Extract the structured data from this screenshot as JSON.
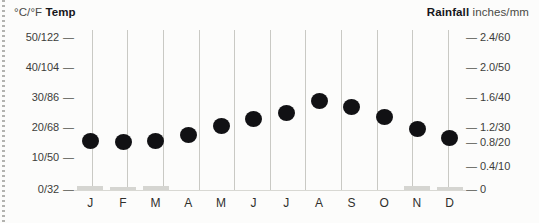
{
  "header": {
    "left_units": "°C/°F",
    "left_title": "Temp",
    "right_title": "Rainfall",
    "right_units": "inches/mm"
  },
  "axes": {
    "left_ticks": [
      {
        "label": "50/122",
        "y": 38
      },
      {
        "label": "40/104",
        "y": 68
      },
      {
        "label": "30/86",
        "y": 98
      },
      {
        "label": "20/68",
        "y": 128
      },
      {
        "label": "10/50",
        "y": 158
      },
      {
        "label": "0/32",
        "y": 190
      }
    ],
    "right_ticks": [
      {
        "label": "2.4/60",
        "y": 38
      },
      {
        "label": "2.0/50",
        "y": 68
      },
      {
        "label": "1.6/40",
        "y": 98
      },
      {
        "label": "1.2/30",
        "y": 128
      },
      {
        "label": "0.8/20",
        "y": 143
      },
      {
        "label": "0.4/10",
        "y": 167
      },
      {
        "label": "0",
        "y": 190
      }
    ],
    "dash": "—"
  },
  "chart_data": {
    "type": "scatter",
    "title": "",
    "subtitle": "",
    "xlabel": "",
    "ylabel": "Temp",
    "y2label": "Rainfall",
    "grid": true,
    "legend_position": "none",
    "categories": [
      "J",
      "F",
      "M",
      "A",
      "M",
      "J",
      "J",
      "A",
      "S",
      "O",
      "N",
      "D"
    ],
    "month_names": [
      "January",
      "February",
      "March",
      "April",
      "May",
      "June",
      "July",
      "August",
      "September",
      "October",
      "November",
      "December"
    ],
    "left_axis": {
      "label": "°C/°F Temp",
      "unit": "°C/°F",
      "tick_labels": [
        "50/122",
        "40/104",
        "30/86",
        "20/68",
        "10/50",
        "0/32"
      ],
      "tick_values_c": [
        50,
        40,
        30,
        20,
        10,
        0
      ],
      "tick_values_f": [
        122,
        104,
        86,
        68,
        50,
        32
      ],
      "ylim": [
        0,
        50
      ]
    },
    "right_axis": {
      "label": "Rainfall inches/mm",
      "unit": "inches/mm",
      "tick_labels": [
        "2.4/60",
        "2.0/50",
        "1.6/40",
        "1.2/30",
        "0.8/20",
        "0.4/10",
        "0"
      ],
      "tick_values_in": [
        2.4,
        2.0,
        1.6,
        1.2,
        0.8,
        0.4,
        0
      ],
      "tick_values_mm": [
        60,
        50,
        40,
        30,
        20,
        10,
        0
      ],
      "ylim": [
        0,
        2.4
      ]
    },
    "series": [
      {
        "name": "Temp",
        "kind": "scatter",
        "unit": "°C",
        "color": "#111114",
        "values": [
          17,
          16.5,
          17,
          19,
          22,
          24,
          26,
          28,
          26,
          23,
          20,
          18
        ],
        "values_f": [
          63,
          62,
          63,
          66,
          72,
          75,
          79,
          82,
          79,
          73,
          68,
          64
        ]
      },
      {
        "name": "Rainfall",
        "kind": "bar",
        "unit": "inches",
        "color": "#d5d5d1",
        "values": [
          0.1,
          0.1,
          0.1,
          0,
          0,
          0,
          0,
          0,
          0,
          0,
          0.1,
          0.1
        ],
        "values_mm": [
          3,
          3,
          3,
          0,
          0,
          0,
          0,
          0,
          0,
          0,
          3,
          3
        ]
      }
    ]
  },
  "layout": {
    "plot_left": 74,
    "plot_top": 30,
    "plot_width": 392,
    "plot_height": 160,
    "baseline_y": 190,
    "column_centers": [
      74,
      109,
      145,
      181,
      216,
      252,
      287,
      323,
      359,
      394,
      430,
      466
    ],
    "gridline_x": [
      18,
      53,
      89,
      125,
      160,
      196,
      231,
      267,
      303,
      338,
      374
    ],
    "dot_y": [
      141,
      142,
      141,
      135,
      126,
      119,
      113,
      101,
      107,
      117,
      129,
      138
    ],
    "rain_bar_height": [
      4,
      3,
      4,
      0,
      0,
      0,
      0,
      0,
      0,
      0,
      4,
      3
    ]
  },
  "colors": {
    "dot": "#111114",
    "bar": "#d5d5d1",
    "grid": "#c9c9c4",
    "text": "#2f2f2c",
    "background": "#fcfcfb"
  }
}
